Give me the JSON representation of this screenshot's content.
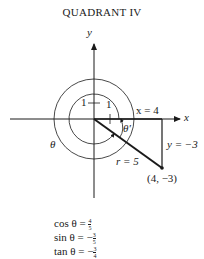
{
  "title": "QUADRANT IV",
  "axes": {
    "x_label": "x",
    "y_label": "y"
  },
  "labels": {
    "one_vertical": "1",
    "one_horizontal": "1",
    "x_eq": "x = 4",
    "y_eq": "y = −3",
    "r_eq": "r = 5",
    "point": "(4, −3)",
    "theta": "θ",
    "theta_ref": "θ′"
  },
  "equations": [
    {
      "lhs": "cos θ = ",
      "sign": "",
      "num": "4",
      "den": "5"
    },
    {
      "lhs": "sin θ = ",
      "sign": "−",
      "num": "3",
      "den": "5"
    },
    {
      "lhs": "tan θ = ",
      "sign": "−",
      "num": "3",
      "den": "4"
    }
  ],
  "colors": {
    "ink": "#1a1a1a",
    "background": "#ffffff"
  }
}
